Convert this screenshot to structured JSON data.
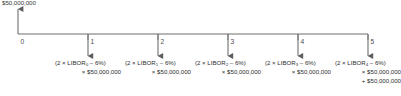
{
  "diagram": {
    "type": "cash-flow-timeline",
    "inflow_label": "$50,000,000",
    "axis": {
      "tick_labels": [
        "0",
        "1",
        "2",
        "3",
        "4",
        "5"
      ],
      "tick_x": [
        18,
        88,
        158,
        228,
        298,
        368
      ],
      "baseline_y": 34,
      "start_x": 18,
      "end_x": 368
    },
    "arrows": {
      "inflow": {
        "x": 18,
        "direction": "up",
        "from_y": 34,
        "to_y": 9
      },
      "outflows": [
        {
          "x": 88,
          "direction": "down",
          "from_y": 34,
          "to_y": 56
        },
        {
          "x": 158,
          "direction": "down",
          "from_y": 34,
          "to_y": 56
        },
        {
          "x": 228,
          "direction": "down",
          "from_y": 34,
          "to_y": 56
        },
        {
          "x": 298,
          "direction": "down",
          "from_y": 34,
          "to_y": 56
        },
        {
          "x": 368,
          "direction": "down",
          "from_y": 34,
          "to_y": 56
        }
      ]
    },
    "cash_flows": [
      {
        "period": "1",
        "center_x": 88,
        "line1": "(2 × LIBOR",
        "subscript": "0",
        "line1_tail": " – 6%)",
        "line2": "× $50,000,000",
        "line3": ""
      },
      {
        "period": "2",
        "center_x": 158,
        "line1": "(2 × LIBOR",
        "subscript": "1",
        "line1_tail": " – 6%)",
        "line2": "× $50,000,000",
        "line3": ""
      },
      {
        "period": "3",
        "center_x": 228,
        "line1": "(2 × LIBOR",
        "subscript": "2",
        "line1_tail": " – 6%)",
        "line2": "× $50,000,000",
        "line3": ""
      },
      {
        "period": "4",
        "center_x": 298,
        "line1": "(2 × LIBOR",
        "subscript": "3",
        "line1_tail": " – 6%)",
        "line2": "× $50,000,000",
        "line3": ""
      },
      {
        "period": "5",
        "center_x": 368,
        "line1": "(2 × LIBOR",
        "subscript": "4",
        "line1_tail": " – 6%)",
        "line2": "× $50,000,000",
        "line3": "+ $50,000,000"
      }
    ],
    "colors": {
      "line": "#6f6f6f",
      "text": "#2e2e2e",
      "background": "#ffffff"
    }
  }
}
